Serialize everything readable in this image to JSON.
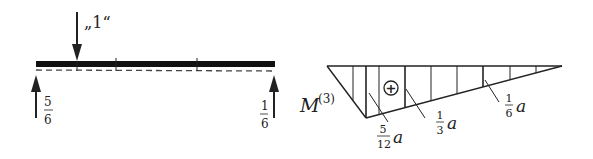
{
  "beam": {
    "load_label": "„1“",
    "left_reaction": {
      "num": "5",
      "den": "6"
    },
    "right_reaction": {
      "num": "1",
      "den": "6"
    }
  },
  "moment_diagram": {
    "label_main": "M",
    "label_sup": "(3)",
    "sign": "+",
    "values": [
      {
        "num": "5",
        "den": "12",
        "unit": "a"
      },
      {
        "num": "1",
        "den": "3",
        "unit": "a"
      },
      {
        "num": "1",
        "den": "6",
        "unit": "a"
      }
    ]
  }
}
